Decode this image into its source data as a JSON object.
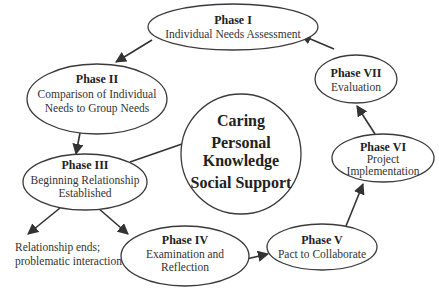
{
  "diagram": {
    "center": {
      "lines": [
        "Caring",
        "Personal",
        "Knowledge",
        "Social Support"
      ]
    },
    "phases": [
      {
        "title": "Phase I",
        "lines": [
          "Individual Needs Assessment"
        ]
      },
      {
        "title": "Phase II",
        "lines": [
          "Comparison of Individual",
          "Needs to Group Needs"
        ]
      },
      {
        "title": "Phase III",
        "lines": [
          "Beginning Relationship",
          "Established"
        ]
      },
      {
        "title": "Phase IV",
        "lines": [
          "Examination and",
          "Reflection"
        ]
      },
      {
        "title": "Phase V",
        "lines": [
          "Pact to Collaborate"
        ]
      },
      {
        "title": "Phase VI",
        "lines": [
          "Project",
          "Implementation"
        ]
      },
      {
        "title": "Phase VII",
        "lines": [
          "Evaluation"
        ]
      }
    ],
    "exit_note": {
      "lines": [
        "Relationship ends;",
        "problematic interaction"
      ]
    },
    "colors": {
      "stroke": "#3a3a3a",
      "text": "#222222",
      "background": "#ffffff"
    }
  }
}
